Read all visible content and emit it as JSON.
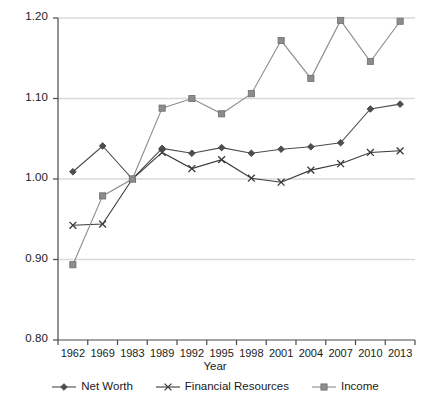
{
  "chart_data": {
    "type": "line",
    "title": "",
    "subtitle": "",
    "xlabel": "Year",
    "ylabel": "",
    "categories": [
      "1962",
      "1969",
      "1983",
      "1989",
      "1992",
      "1995",
      "1998",
      "2001",
      "2004",
      "2007",
      "2010",
      "2013"
    ],
    "ylim": [
      0.8,
      1.2
    ],
    "ytick_labels": [
      "1.20",
      "1.10",
      "1.00",
      "0.90",
      "0.80"
    ],
    "ytick_values": [
      1.2,
      1.1,
      1.0,
      0.9,
      0.8
    ],
    "grid": "horizontal",
    "legend_position": "bottom",
    "series": [
      {
        "name": "Net Worth",
        "marker": "diamond",
        "color": "#4d4d4d",
        "values": [
          1.009,
          1.041,
          1.0,
          1.038,
          1.032,
          1.039,
          1.032,
          1.037,
          1.04,
          1.045,
          1.087,
          1.093
        ]
      },
      {
        "name": "Financial Resources",
        "marker": "cross",
        "color": "#3a3a3a",
        "values": [
          0.9425,
          0.944,
          1.0,
          1.033,
          1.013,
          1.024,
          1.001,
          0.996,
          1.011,
          1.019,
          1.033,
          1.035
        ]
      },
      {
        "name": "Income",
        "marker": "square",
        "color": "#8c8c8c",
        "values": [
          0.8935,
          0.979,
          1.0,
          1.088,
          1.1,
          1.081,
          1.106,
          1.172,
          1.125,
          1.197,
          1.146,
          1.196
        ]
      }
    ]
  },
  "legend": {
    "items": [
      {
        "label": "Net Worth",
        "marker": "diamond-marker-icon"
      },
      {
        "label": "Financial Resources",
        "marker": "cross-marker-icon"
      },
      {
        "label": "Income",
        "marker": "square-marker-icon"
      }
    ]
  },
  "axes": {
    "x_title": "Year"
  },
  "colors": {
    "gridline": "#d9d9d9",
    "axis": "#4a4a4a",
    "net_worth": "#4d4d4d",
    "financial_resources": "#3a3a3a",
    "income": "#8c8c8c",
    "background": "#ffffff"
  }
}
